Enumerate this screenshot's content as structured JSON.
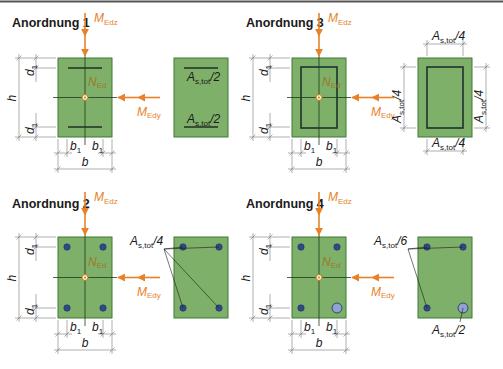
{
  "top_rule_color": "#555555",
  "colors": {
    "section_fill": "#7fb069",
    "force": "#e8822a",
    "rebar": "#2f4a8a",
    "rebar_large": "#8fa3d0"
  },
  "panels": [
    {
      "id": "anordnung-1",
      "title": "Anordnung 1",
      "force_vertical": {
        "symbol": "M",
        "sub": "Edz"
      },
      "force_horizontal": {
        "symbol": "M",
        "sub": "Edy"
      },
      "axial": {
        "symbol": "N",
        "sub": "Ed"
      },
      "dims": {
        "h": "h",
        "d1": "d",
        "d1_sub": "1",
        "b1": "b",
        "b1_sub": "1",
        "b": "b"
      },
      "reinforcement": "two layers (top & bottom)",
      "labels": [
        {
          "main": "A",
          "sub": "s,tot",
          "suffix": "/2",
          "position": "top"
        },
        {
          "main": "A",
          "sub": "s,tot",
          "suffix": "/2",
          "position": "bottom"
        }
      ]
    },
    {
      "id": "anordnung-3",
      "title": "Anordnung 3",
      "force_vertical": {
        "symbol": "M",
        "sub": "Edz"
      },
      "force_horizontal": {
        "symbol": "M",
        "sub": "Edy"
      },
      "axial": {
        "symbol": "N",
        "sub": "Ed"
      },
      "dims": {
        "h": "h",
        "d1": "d",
        "d1_sub": "1",
        "b1": "b",
        "b1_sub": "1",
        "b": "b"
      },
      "reinforcement": "distributed on all four sides",
      "labels": [
        {
          "main": "A",
          "sub": "s,tot",
          "suffix": "/4",
          "position": "top"
        },
        {
          "main": "A",
          "sub": "s,tot",
          "suffix": "/4",
          "position": "bottom"
        },
        {
          "main": "A",
          "sub": "s,tot",
          "suffix": "/4",
          "position": "left"
        },
        {
          "main": "A",
          "sub": "s,tot",
          "suffix": "/4",
          "position": "right"
        }
      ]
    },
    {
      "id": "anordnung-2",
      "title": "Anordnung 2",
      "force_vertical": {
        "symbol": "M",
        "sub": "Edz"
      },
      "force_horizontal": {
        "symbol": "M",
        "sub": "Edy"
      },
      "axial": {
        "symbol": "N",
        "sub": "Ed"
      },
      "dims": {
        "h": "h",
        "d1": "d",
        "d1_sub": "1",
        "b1": "b",
        "b1_sub": "1",
        "b": "b"
      },
      "reinforcement": "four corner bars",
      "labels": [
        {
          "main": "A",
          "sub": "s,tot",
          "suffix": "/4",
          "position": "corners"
        }
      ]
    },
    {
      "id": "anordnung-4",
      "title": "Anordnung 4",
      "force_vertical": {
        "symbol": "M",
        "sub": "Edz"
      },
      "force_horizontal": {
        "symbol": "M",
        "sub": "Edy"
      },
      "axial": {
        "symbol": "N",
        "sub": "Ed"
      },
      "dims": {
        "h": "h",
        "d1": "d",
        "d1_sub": "1",
        "b1": "b",
        "b1_sub": "1",
        "b": "b"
      },
      "reinforcement": "three small corner bars + one large corner bar",
      "labels": [
        {
          "main": "A",
          "sub": "s,tot",
          "suffix": "/6",
          "position": "three corners"
        },
        {
          "main": "A",
          "sub": "s,tot",
          "suffix": "/2",
          "position": "bottom-right corner"
        }
      ]
    }
  ]
}
